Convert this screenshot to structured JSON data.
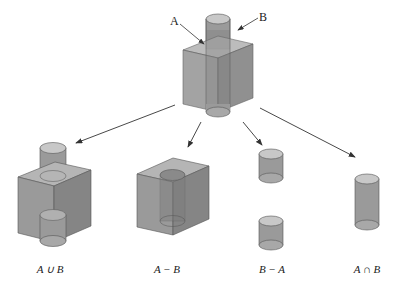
{
  "diagram": {
    "source": {
      "labels": {
        "a": "A",
        "b": "B"
      }
    },
    "results": [
      {
        "id": "union",
        "label": "A ∪ B"
      },
      {
        "id": "a-minus-b",
        "label": "A − B"
      },
      {
        "id": "b-minus-a",
        "label": "B − A"
      },
      {
        "id": "intersection",
        "label": "A ∩ B"
      }
    ],
    "colors": {
      "cube_front": "#9a9a9a",
      "cube_side": "#858585",
      "cube_top": "#b5b5b5",
      "cylinder": "#8f8f8f",
      "cylinder_top": "#c8c8c8",
      "edge": "#555555",
      "arrow": "#333333"
    }
  }
}
